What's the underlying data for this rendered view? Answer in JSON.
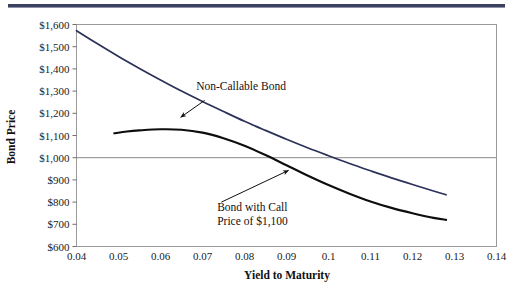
{
  "chart_data": {
    "type": "line",
    "title": "",
    "xlabel": "Yield to Maturity",
    "ylabel": "Bond Price",
    "xlim": [
      0.04,
      0.14
    ],
    "ylim": [
      600,
      1600
    ],
    "grid": "horizontal-line-at-1000-only",
    "legend": "none-inline-annotations",
    "xticks": [
      "0.04",
      "0.05",
      "0.06",
      "0.07",
      "0.08",
      "0.09",
      "0.1",
      "0.11",
      "0.12",
      "0.13",
      "0.14"
    ],
    "xtick_values": [
      0.04,
      0.05,
      0.06,
      0.07,
      0.08,
      0.09,
      0.1,
      0.11,
      0.12,
      0.13,
      0.14
    ],
    "yticks": [
      "$600",
      "$700",
      "$800",
      "$900",
      "$1,000",
      "$1,100",
      "$1,200",
      "$1,300",
      "$1,400",
      "$1,500",
      "$1,600"
    ],
    "ytick_values": [
      600,
      700,
      800,
      900,
      1000,
      1100,
      1200,
      1300,
      1400,
      1500,
      1600
    ],
    "reference_line": {
      "y": 1000,
      "label": "$1,000"
    },
    "series": [
      {
        "name": "Non-Callable Bond",
        "color": "#2b3157",
        "x": [
          0.04,
          0.045,
          0.05,
          0.055,
          0.06,
          0.065,
          0.07,
          0.075,
          0.08,
          0.085,
          0.09,
          0.095,
          0.1,
          0.105,
          0.11,
          0.115,
          0.12,
          0.125,
          0.128
        ],
        "y": [
          1572,
          1513,
          1456,
          1402,
          1350,
          1300,
          1253,
          1208,
          1164,
          1123,
          1083,
          1045,
          1009,
          974,
          941,
          909,
          879,
          850,
          833
        ]
      },
      {
        "name": "Bond with Call Price of $1,100",
        "color": "#0d0d0d",
        "x": [
          0.049,
          0.052,
          0.055,
          0.06,
          0.065,
          0.07,
          0.075,
          0.08,
          0.085,
          0.09,
          0.095,
          0.1,
          0.105,
          0.11,
          0.115,
          0.12,
          0.125,
          0.128
        ],
        "y": [
          1110,
          1118,
          1123,
          1128,
          1126,
          1113,
          1088,
          1054,
          1012,
          966,
          920,
          877,
          838,
          803,
          774,
          750,
          729,
          720
        ]
      }
    ],
    "annotations": [
      {
        "id": "non-callable-annotation",
        "lines": [
          "Non-Callable Bond"
        ],
        "text_x": 0.0685,
        "text_y": 1307,
        "arrow_from": {
          "x": 0.0705,
          "y": 1258
        },
        "arrow_to": {
          "x": 0.0648,
          "y": 1182
        }
      },
      {
        "id": "callable-annotation",
        "lines": [
          "Bond with Call",
          "Price of $1,100"
        ],
        "text_x": 0.0735,
        "text_y": 760,
        "arrow_from": {
          "x": 0.0745,
          "y": 800
        },
        "arrow_to": {
          "x": 0.0905,
          "y": 943
        }
      }
    ]
  },
  "decor": {
    "top_rule_color": "#3a4060"
  }
}
